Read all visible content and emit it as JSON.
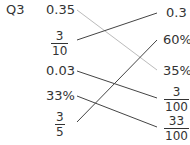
{
  "question": "Q3",
  "left_items": [
    {
      "id": "l1",
      "type": "text",
      "value": "0.35"
    },
    {
      "id": "l2",
      "type": "fraction",
      "num": "3",
      "den": "10"
    },
    {
      "id": "l3",
      "type": "text",
      "value": "0.03"
    },
    {
      "id": "l4",
      "type": "text",
      "value": "33%"
    },
    {
      "id": "l5",
      "type": "fraction",
      "num": "3",
      "den": "5"
    }
  ],
  "right_items": [
    {
      "id": "r1",
      "type": "text",
      "value": "0.3"
    },
    {
      "id": "r2",
      "type": "text",
      "value": "60%"
    },
    {
      "id": "r3",
      "type": "text",
      "value": "35%"
    },
    {
      "id": "r4",
      "type": "fraction",
      "num": "3",
      "den": "100"
    },
    {
      "id": "r5",
      "type": "fraction",
      "num": "33",
      "den": "100"
    }
  ],
  "matches": [
    {
      "from": "0.35",
      "to": "35%",
      "color": "#bbbbbb"
    },
    {
      "from": "3/10",
      "to": "0.3",
      "color": "#444444"
    },
    {
      "from": "0.03",
      "to": "3/100",
      "color": "#444444"
    },
    {
      "from": "33%",
      "to": "33/100",
      "color": "#444444"
    },
    {
      "from": "3/5",
      "to": "60%",
      "color": "#444444"
    }
  ]
}
